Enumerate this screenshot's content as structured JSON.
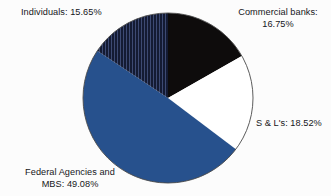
{
  "chart_data": {
    "type": "pie",
    "title": "",
    "subtitle": "",
    "xlabel": "",
    "ylabel": "",
    "legend_position": "none",
    "grid": false,
    "units": "percent",
    "start_angle_deg": 0,
    "direction": "clockwise",
    "categories": [
      "Commercial banks",
      "S & L's",
      "Federal Agencies and MBS",
      "Individuals"
    ],
    "values": [
      16.75,
      18.52,
      49.08,
      15.65
    ],
    "slices": [
      {
        "name": "Commercial banks",
        "value": 16.75,
        "label_line1": "Commercial banks:",
        "label_line2": "16.75%",
        "fill": "#0e0c0c",
        "pattern": "solid",
        "start_deg": 0.0,
        "end_deg": 60.3
      },
      {
        "name": "S & L's",
        "value": 18.52,
        "label_line1": "S & L's: 18.52%",
        "label_line2": "",
        "fill": "#ffffff",
        "pattern": "solid",
        "start_deg": 60.3,
        "end_deg": 127.0
      },
      {
        "name": "Federal Agencies and MBS",
        "value": 49.08,
        "label_line1": "Federal Agencies and",
        "label_line2": "MBS: 49.08%",
        "fill": "#27518d",
        "pattern": "solid",
        "start_deg": 127.0,
        "end_deg": 303.7
      },
      {
        "name": "Individuals",
        "value": 15.65,
        "label_line1": "Individuals: 15.65%",
        "label_line2": "",
        "fill": "#141b33",
        "pattern": "vertical-stripes",
        "start_deg": 303.7,
        "end_deg": 360.0
      }
    ]
  },
  "colors": {
    "background": "#fcfcfc",
    "text": "#16161a",
    "outline": "#4a4a4a",
    "blue": "#27518d",
    "black": "#0e0c0c",
    "white": "#ffffff",
    "navy_hatch": "#141b33",
    "hatch_stripe": "#3d4a73"
  },
  "geometry": {
    "center_x": 168,
    "center_y": 98,
    "radius": 85
  }
}
